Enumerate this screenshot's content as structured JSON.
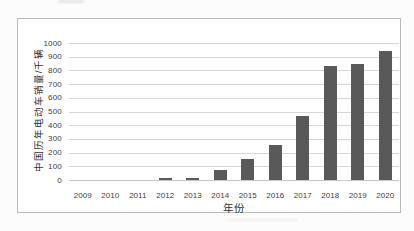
{
  "chart_data": {
    "type": "bar",
    "title": "",
    "xlabel": "年份",
    "ylabel": "中国历年电动车销量/千辆",
    "categories": [
      "2009",
      "2010",
      "2011",
      "2012",
      "2013",
      "2014",
      "2015",
      "2016",
      "2017",
      "2018",
      "2019",
      "2020"
    ],
    "values": [
      0,
      0,
      0,
      12,
      18,
      72,
      155,
      255,
      470,
      830,
      850,
      945
    ],
    "ylim": [
      0,
      1000
    ],
    "ytick_step": 100,
    "ytick_labels": [
      "0",
      "100",
      "200",
      "300",
      "400",
      "500",
      "600",
      "700",
      "800",
      "900",
      "1000"
    ],
    "grid": true,
    "legend_position": "none",
    "bar_color": "#595959",
    "gridline_color": "#d6d6d6",
    "text_color": "#3d3d3d",
    "frame_border_color": "#b9b9b9",
    "background_color": "#ffffff"
  }
}
